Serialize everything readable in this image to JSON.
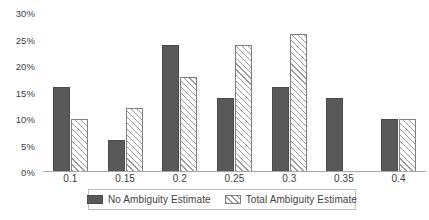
{
  "chart_data": {
    "type": "bar",
    "title": "",
    "xlabel": "",
    "ylabel": "",
    "ylim": [
      0,
      30
    ],
    "grid": false,
    "legend_position": "bottom",
    "categories": [
      "0.1",
      "0.15",
      "0.2",
      "0.25",
      "0.3",
      "0.35",
      "0.4"
    ],
    "ytick_labels": [
      "0%",
      "5%",
      "10%",
      "15%",
      "20%",
      "25%",
      "30%"
    ],
    "ytick_values": [
      0,
      5,
      10,
      15,
      20,
      25,
      30
    ],
    "series": [
      {
        "name": "No Ambiguity Estimate",
        "color": "#595959",
        "fill": "solid",
        "values": [
          16,
          6,
          24,
          14,
          16,
          14,
          10
        ]
      },
      {
        "name": "Total Ambiguity Estimate",
        "color": "#ffffff",
        "fill": "diagonal-hatch",
        "values": [
          10,
          12,
          18,
          24,
          26,
          0,
          10
        ]
      }
    ]
  },
  "axis": {
    "line_color": "#a6a6a6"
  }
}
